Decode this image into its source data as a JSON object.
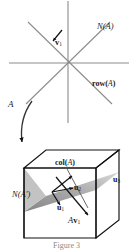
{
  "figure": {
    "caption": "Figure 3",
    "colors": {
      "axis_line": "#8c8c8c",
      "cube_edge": "#111111",
      "plane_fill": "#9a9a9a",
      "plane_fill_light": "#c9c9c9",
      "arrow": "#111111",
      "text": "#1a1a1a"
    },
    "top_plot": {
      "name": "domain-plane",
      "lines": [
        "horizontal-axis",
        "vertical-axis",
        "diagonal-up-right",
        "diagonal-up-left"
      ],
      "labels": {
        "null_space": "N(A)",
        "row_space": "row(A)",
        "vector_v1": "v",
        "vector_v1_sub": "1"
      }
    },
    "mapping_arrow": {
      "name": "transformation-arrow",
      "label": "A"
    },
    "cube": {
      "name": "codomain-cube",
      "labels": {
        "column_space": "col(A)",
        "left_null_space": "N(A",
        "left_null_space_prime": "′",
        "left_null_space_close": ")",
        "u1": "u",
        "u1_sub": "1",
        "u2": "u",
        "u2_sub": "2",
        "u3": "u",
        "u3_sub": "3",
        "av1": "A",
        "av1_vec": "v",
        "av1_sub": "1"
      }
    }
  }
}
